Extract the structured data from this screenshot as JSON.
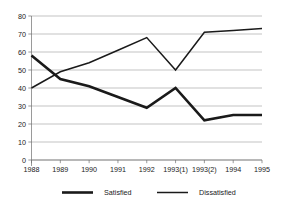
{
  "chart_data": {
    "type": "line",
    "title": "",
    "subtitle": "",
    "xlabel": "",
    "ylabel": "",
    "categories": [
      "1988",
      "1989",
      "1990",
      "1991",
      "1992",
      "1993(1)",
      "1993(2)",
      "1994",
      "1995"
    ],
    "series": [
      {
        "name": "Satisfied",
        "values": [
          58,
          45,
          41,
          35,
          29,
          40,
          22,
          25,
          25
        ],
        "color": "#1a1a1a",
        "line_width": 2.6
      },
      {
        "name": "Dissatisfied",
        "values": [
          40,
          49,
          54,
          61,
          68,
          50,
          71,
          72,
          73
        ],
        "color": "#1a1a1a",
        "line_width": 1.5
      }
    ],
    "ylim": [
      0,
      80
    ],
    "yticks": [
      0,
      10,
      20,
      30,
      40,
      50,
      60,
      70,
      80
    ],
    "ytick_labels": [
      "0",
      "10",
      "20",
      "30",
      "40",
      "50",
      "60",
      "70",
      "80"
    ],
    "grid": "horizontal",
    "legend_position": "bottom",
    "legend": [
      "Satisfied",
      "Dissatisfied"
    ],
    "annotations": []
  }
}
